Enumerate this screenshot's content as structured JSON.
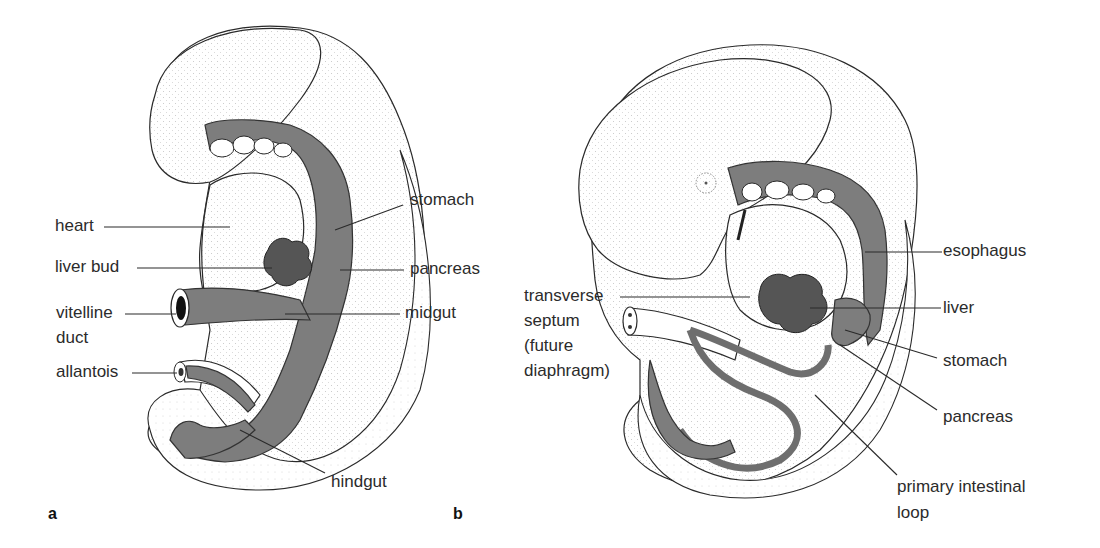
{
  "figure": {
    "panels": [
      {
        "letter": "a",
        "labels": {
          "heart": "heart",
          "liver_bud": "liver bud",
          "vitelline_duct_1": "vitelline",
          "vitelline_duct_2": "duct",
          "allantois": "allantois",
          "stomach": "stomach",
          "pancreas": "pancreas",
          "midgut": "midgut",
          "hindgut": "hindgut"
        }
      },
      {
        "letter": "b",
        "labels": {
          "transverse_septum_1": "transverse",
          "transverse_septum_2": "septum",
          "transverse_septum_3": "(future",
          "transverse_septum_4": "diaphragm)",
          "esophagus": "esophagus",
          "liver": "liver",
          "stomach": "stomach",
          "pancreas": "pancreas",
          "primary_loop_1": "primary intestinal",
          "primary_loop_2": "loop"
        }
      }
    ],
    "colors": {
      "gut_fill": "#7d7d7d",
      "outline": "#2a2a2a",
      "background": "#ffffff"
    }
  }
}
